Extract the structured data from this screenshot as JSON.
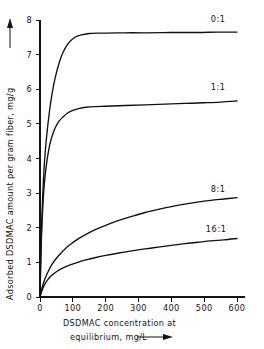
{
  "chart_data": {
    "type": "line",
    "title": "",
    "xlabel": "DSDMAC concentration at equilibrium, mg/L",
    "xlabel_line1": "DSDMAC concentration at",
    "xlabel_line2": "equilibrium, mg/L",
    "ylabel": "Adsorbed DSDMAC amount per gram fiber, mg/g",
    "xlim": [
      0,
      640
    ],
    "ylim": [
      0,
      8
    ],
    "xticks": [
      0,
      100,
      200,
      300,
      400,
      500,
      600
    ],
    "xtick_labels": [
      "0",
      "100",
      "200",
      "300",
      "400",
      "500",
      "600"
    ],
    "yticks": [
      0,
      1,
      2,
      3,
      4,
      5,
      6,
      7,
      8
    ],
    "ytick_labels": [
      "0",
      "1",
      "2",
      "3",
      "4",
      "5",
      "6",
      "7",
      "8"
    ],
    "grid": false,
    "legend_position": "inline-right",
    "axis_arrows": true,
    "line_color": "#101010",
    "axis_color": "#141414",
    "background": "#ffffff",
    "series": [
      {
        "name": "0:1",
        "label": "0:1",
        "label_x": 520,
        "label_y": 7.95,
        "plateau": 7.62,
        "points": [
          [
            0,
            0.0
          ],
          [
            3,
            1.45
          ],
          [
            6,
            2.35
          ],
          [
            10,
            3.3
          ],
          [
            14,
            3.95
          ],
          [
            20,
            4.62
          ],
          [
            28,
            5.3
          ],
          [
            36,
            5.83
          ],
          [
            46,
            6.32
          ],
          [
            58,
            6.75
          ],
          [
            70,
            7.06
          ],
          [
            85,
            7.31
          ],
          [
            100,
            7.46
          ],
          [
            115,
            7.54
          ],
          [
            130,
            7.58
          ],
          [
            150,
            7.61
          ],
          [
            175,
            7.62
          ],
          [
            200,
            7.62
          ],
          [
            260,
            7.63
          ],
          [
            320,
            7.63
          ],
          [
            400,
            7.64
          ],
          [
            480,
            7.64
          ],
          [
            540,
            7.65
          ],
          [
            600,
            7.65
          ]
        ]
      },
      {
        "name": "1:1",
        "label": "1:1",
        "label_x": 520,
        "label_y": 5.97,
        "plateau": 5.52,
        "points": [
          [
            0,
            0.0
          ],
          [
            3,
            1.3
          ],
          [
            6,
            2.1
          ],
          [
            10,
            2.85
          ],
          [
            14,
            3.35
          ],
          [
            20,
            3.85
          ],
          [
            28,
            4.32
          ],
          [
            36,
            4.62
          ],
          [
            46,
            4.88
          ],
          [
            58,
            5.08
          ],
          [
            70,
            5.2
          ],
          [
            85,
            5.32
          ],
          [
            100,
            5.39
          ],
          [
            120,
            5.45
          ],
          [
            140,
            5.48
          ],
          [
            170,
            5.5
          ],
          [
            200,
            5.51
          ],
          [
            260,
            5.53
          ],
          [
            320,
            5.55
          ],
          [
            380,
            5.57
          ],
          [
            440,
            5.59
          ],
          [
            500,
            5.61
          ],
          [
            550,
            5.63
          ],
          [
            600,
            5.66
          ]
        ]
      },
      {
        "name": "8:1",
        "label": "8:1",
        "label_x": 520,
        "label_y": 3.03,
        "plateau": null,
        "points": [
          [
            0,
            0.0
          ],
          [
            5,
            0.22
          ],
          [
            12,
            0.45
          ],
          [
            22,
            0.68
          ],
          [
            35,
            0.92
          ],
          [
            50,
            1.12
          ],
          [
            70,
            1.33
          ],
          [
            90,
            1.5
          ],
          [
            115,
            1.67
          ],
          [
            140,
            1.81
          ],
          [
            170,
            1.95
          ],
          [
            200,
            2.07
          ],
          [
            240,
            2.21
          ],
          [
            280,
            2.33
          ],
          [
            320,
            2.44
          ],
          [
            360,
            2.53
          ],
          [
            400,
            2.61
          ],
          [
            440,
            2.68
          ],
          [
            480,
            2.74
          ],
          [
            520,
            2.79
          ],
          [
            560,
            2.83
          ],
          [
            600,
            2.87
          ]
        ]
      },
      {
        "name": "16:1",
        "label": "16:1",
        "label_x": 505,
        "label_y": 1.88,
        "plateau": null,
        "points": [
          [
            0,
            0.0
          ],
          [
            5,
            0.16
          ],
          [
            12,
            0.32
          ],
          [
            22,
            0.48
          ],
          [
            35,
            0.62
          ],
          [
            50,
            0.73
          ],
          [
            70,
            0.84
          ],
          [
            90,
            0.92
          ],
          [
            115,
            1.0
          ],
          [
            140,
            1.07
          ],
          [
            170,
            1.14
          ],
          [
            200,
            1.2
          ],
          [
            240,
            1.27
          ],
          [
            280,
            1.33
          ],
          [
            320,
            1.39
          ],
          [
            360,
            1.44
          ],
          [
            400,
            1.49
          ],
          [
            440,
            1.54
          ],
          [
            480,
            1.58
          ],
          [
            520,
            1.62
          ],
          [
            560,
            1.65
          ],
          [
            600,
            1.69
          ]
        ]
      }
    ]
  }
}
